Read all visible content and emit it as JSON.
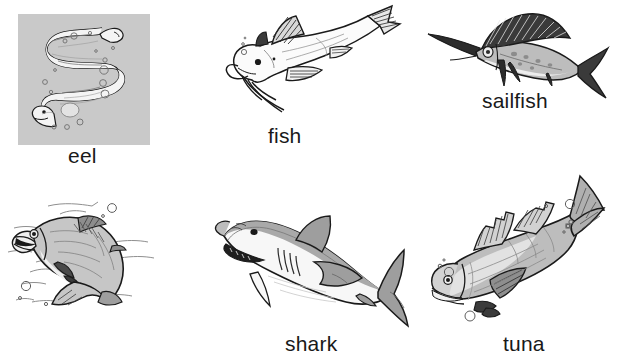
{
  "page": {
    "kind": "picture-vocabulary-worksheet",
    "topic": "fish",
    "background_color": "#ffffff",
    "text_color": "#191919",
    "columns": 3,
    "rows": 2
  },
  "items": [
    {
      "id": "eel",
      "label": "eel",
      "row": 1,
      "column": 1,
      "illustration": "eel-drawing",
      "has_background_panel": true,
      "panel_color": "#c9c9c9",
      "label_x": 68,
      "label_y": 145
    },
    {
      "id": "fish",
      "label": "fish",
      "row": 1,
      "column": 2,
      "illustration": "catfish-drawing",
      "has_background_panel": false,
      "panel_color": "",
      "label_x": 268,
      "label_y": 129
    },
    {
      "id": "sailfish",
      "label": "sailfish",
      "row": 1,
      "column": 3,
      "illustration": "sailfish-drawing",
      "has_background_panel": false,
      "panel_color": "",
      "label_x": 482,
      "label_y": 94
    },
    {
      "id": "salmon",
      "label": "salmon",
      "row": 2,
      "column": 1,
      "illustration": "salmon-drawing",
      "has_background_panel": false,
      "panel_color": "",
      "label_x": 49,
      "label_y": 333
    },
    {
      "id": "shark",
      "label": "shark",
      "row": 2,
      "column": 2,
      "illustration": "shark-drawing",
      "has_background_panel": false,
      "panel_color": "",
      "label_x": 285,
      "label_y": 333
    },
    {
      "id": "tuna",
      "label": "tuna",
      "row": 2,
      "column": 3,
      "illustration": "tuna-drawing",
      "has_background_panel": false,
      "panel_color": "",
      "label_x": 503,
      "label_y": 333
    }
  ],
  "palette": {
    "ink": "#1a1a1a",
    "panel_gray": "#c9c9c9",
    "fill_light": "#f2f2f2",
    "fill_mid": "#b5b5b5",
    "fill_dark": "#6f6f6f",
    "fill_darker": "#4a4a4a"
  }
}
